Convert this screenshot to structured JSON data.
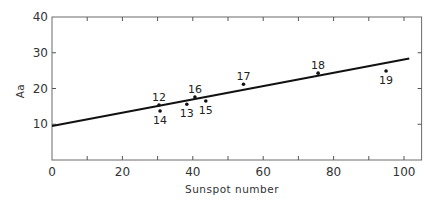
{
  "chart_data": {
    "type": "scatter",
    "title": "",
    "xlabel": "Sunspot number",
    "ylabel": "Aa",
    "xlim": [
      0,
      105
    ],
    "ylim": [
      0,
      40
    ],
    "xticks": [
      0,
      20,
      40,
      60,
      80,
      100
    ],
    "yticks": [
      10,
      20,
      30,
      40
    ],
    "minor_xticks": [
      10,
      30,
      50,
      70,
      90
    ],
    "grid": false,
    "legend": null,
    "points": [
      {
        "label": "12",
        "x": 30.4,
        "y": 15.4,
        "label_pos": "above"
      },
      {
        "label": "14",
        "x": 30.7,
        "y": 13.7,
        "label_pos": "below"
      },
      {
        "label": "13",
        "x": 38.3,
        "y": 15.6,
        "label_pos": "below"
      },
      {
        "label": "16",
        "x": 40.6,
        "y": 17.6,
        "label_pos": "above"
      },
      {
        "label": "15",
        "x": 43.7,
        "y": 16.5,
        "label_pos": "below"
      },
      {
        "label": "17",
        "x": 54.4,
        "y": 21.2,
        "label_pos": "above"
      },
      {
        "label": "18",
        "x": 75.6,
        "y": 24.3,
        "label_pos": "above"
      },
      {
        "label": "19",
        "x": 94.9,
        "y": 24.9,
        "label_pos": "below"
      }
    ],
    "fit_line": {
      "x": [
        0,
        101.5
      ],
      "y": [
        9.5,
        28.4
      ]
    },
    "annotations": "Point labels are solar cycle numbers"
  }
}
